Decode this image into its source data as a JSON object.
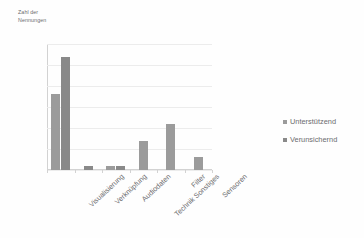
{
  "chart_data": {
    "type": "bar",
    "title": "",
    "subtitle": "",
    "xlabel": "",
    "ylabel": "Zahl der\nNennungen",
    "ylim": [
      0,
      30
    ],
    "ytick_step": 5,
    "yticks": [
      30,
      25,
      20,
      15,
      10,
      5,
      0
    ],
    "grid": true,
    "grid_axis": "y",
    "legend_position": "right",
    "categories": [
      "Visualisierung",
      "Verknüpfung",
      "Audiodaten",
      "Technik Sonstiges",
      "Filter",
      "Sensoren"
    ],
    "series": [
      {
        "name": "Unterstützend",
        "color": "#9b9b9b",
        "values": [
          18,
          0,
          1,
          7,
          11,
          3
        ]
      },
      {
        "name": "Verunsichernd",
        "color": "#898989",
        "values": [
          27,
          1,
          1,
          0,
          0,
          0
        ]
      }
    ]
  },
  "legend": {
    "items": [
      {
        "label": "Unterstützend",
        "marker": "legend-swatch-icon"
      },
      {
        "label": "Verunsichernd",
        "marker": "legend-swatch-icon"
      }
    ]
  }
}
